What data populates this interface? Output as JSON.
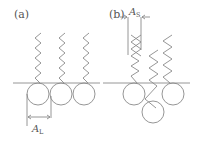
{
  "diagram": {
    "panels": [
      {
        "id": "a",
        "label": "(a)",
        "dimension_label": {
          "main": "A",
          "sub": "L"
        },
        "description": "Springs aligned vertically above a single row of circles on a baseline"
      },
      {
        "id": "b",
        "label": "(b)",
        "dimension_label": {
          "main": "A",
          "sub": "S"
        },
        "description": "Springs offset/overlapping with circles displaced below baseline"
      }
    ],
    "colors": {
      "stroke": "#8a8a8a",
      "text": "#555555",
      "background": "#ffffff"
    }
  }
}
